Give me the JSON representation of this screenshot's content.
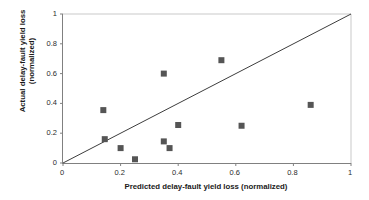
{
  "chart_data": {
    "type": "scatter",
    "title": "",
    "xlabel": "Predicted delay-fault yield loss (normalized)",
    "ylabel_line1": "Actual delay-fault yield loss",
    "ylabel_line2": "(normalized)",
    "xlim": [
      0,
      1
    ],
    "ylim": [
      0,
      1
    ],
    "grid": false,
    "legend": "none",
    "xticks": [
      "0",
      "0.2",
      "0.4",
      "0.6",
      "0.8",
      "1"
    ],
    "xtick_values": [
      0,
      0.2,
      0.4,
      0.6,
      0.8,
      1
    ],
    "yticks": [
      "0",
      "0.2",
      "0.4",
      "0.6",
      "0.8",
      "1"
    ],
    "ytick_values": [
      0,
      0.2,
      0.4,
      0.6,
      0.8,
      1
    ],
    "marker": "square",
    "marker_color": "#555555",
    "marker_size_px": 6,
    "series": [
      {
        "name": "designs",
        "points": [
          {
            "x": 0.14,
            "y": 0.355
          },
          {
            "x": 0.145,
            "y": 0.16
          },
          {
            "x": 0.2,
            "y": 0.1
          },
          {
            "x": 0.25,
            "y": 0.025
          },
          {
            "x": 0.35,
            "y": 0.6
          },
          {
            "x": 0.35,
            "y": 0.145
          },
          {
            "x": 0.37,
            "y": 0.1
          },
          {
            "x": 0.4,
            "y": 0.255
          },
          {
            "x": 0.55,
            "y": 0.69
          },
          {
            "x": 0.62,
            "y": 0.25
          },
          {
            "x": 0.86,
            "y": 0.39
          }
        ]
      }
    ],
    "annotations": [
      {
        "type": "line",
        "name": "identity-line",
        "from": [
          0,
          0
        ],
        "to": [
          1,
          1
        ],
        "color": "#3d3d3d",
        "width_px": 1
      }
    ]
  }
}
